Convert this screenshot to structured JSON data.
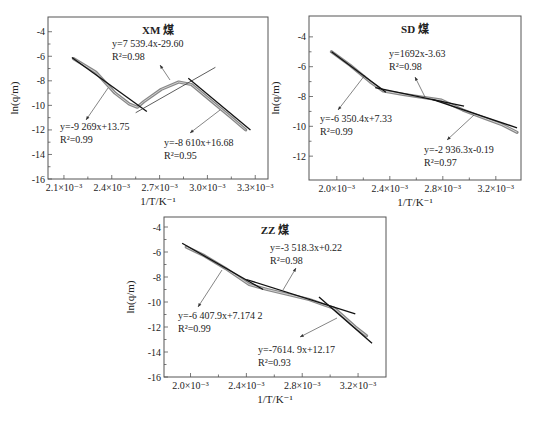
{
  "caption_top": "",
  "chart_data": [
    {
      "id": "xm",
      "type": "line",
      "title": "XM 煤",
      "xlabel": "1/T/K⁻¹",
      "ylabel": "ln(q/m)",
      "xlim": [
        2.0,
        3.38
      ],
      "ylim": [
        -16,
        -2.8
      ],
      "xticks": [
        2.1,
        2.4,
        2.7,
        3.0,
        3.3
      ],
      "xtick_labels": [
        "2.1×10⁻³",
        "2.4×10⁻³",
        "2.7×10⁻³",
        "3.0×10⁻³",
        "3.3×10⁻³"
      ],
      "yticks": [
        -4,
        -6,
        -8,
        -10,
        -12,
        -14,
        -16
      ],
      "ytick_labels": [
        "-4",
        "-6",
        "-8",
        "-10",
        "-12",
        "-14",
        "-16"
      ],
      "x_unit_scale": "×10⁻³",
      "frame_px": {
        "left": 48,
        "top": 17,
        "right": 268,
        "bottom": 179
      },
      "series": [
        {
          "name": "experimental",
          "x": [
            2.16,
            2.3,
            2.42,
            2.51,
            2.56,
            2.6,
            2.71,
            2.82,
            2.9,
            3.03,
            3.15,
            3.24
          ],
          "y": [
            -6.2,
            -7.3,
            -9.0,
            -9.9,
            -10.15,
            -9.7,
            -8.7,
            -8.1,
            -8.3,
            -9.7,
            -11.0,
            -12.0
          ]
        }
      ],
      "fits": [
        {
          "label": "y=-9 269x+13.75",
          "r2": "R²=0.99",
          "slope": -9269,
          "intercept": 13.75,
          "x_range": [
            2.15,
            2.62
          ],
          "y_range": [
            -6.1,
            -10.5
          ]
        },
        {
          "label": "y=7 539.4x-29.60",
          "r2": "R²=0.98",
          "slope": 7539.4,
          "intercept": -29.6,
          "x_range": [
            2.55,
            3.05
          ],
          "y_range": [
            -10.6,
            -6.9
          ]
        },
        {
          "label": "y=-8 610x+16.68",
          "r2": "R²=0.95",
          "slope": -8610,
          "intercept": 16.68,
          "x_range": [
            2.88,
            3.27
          ],
          "y_range": [
            -7.8,
            -12.0
          ]
        }
      ],
      "annotations": [
        {
          "eq": "y=7 539.4x-29.60",
          "r2": "R²=0.98",
          "text_px": [
            112,
            47
          ],
          "arrow_from": [
            170,
            80
          ],
          "arrow_to": [
            160,
            65
          ]
        },
        {
          "eq": "y=-9 269x+13.75",
          "r2": "R²=0.99",
          "text_px": [
            60,
            130
          ],
          "arrow_from": [
            108,
            88
          ],
          "arrow_to": [
            86,
            120
          ]
        },
        {
          "eq": "y=-8 610x+16.68",
          "r2": "R²=0.95",
          "text_px": [
            164,
            146
          ],
          "arrow_from": [
            220,
            110
          ],
          "arrow_to": [
            190,
            133
          ]
        }
      ]
    },
    {
      "id": "sd",
      "type": "line",
      "title": "SD 煤",
      "xlabel": "1/T/K⁻¹",
      "ylabel": "ln(q/m)",
      "xlim": [
        1.79,
        3.39
      ],
      "ylim": [
        -13.6,
        -2.6
      ],
      "xticks": [
        2.0,
        2.4,
        2.8,
        3.2
      ],
      "xtick_labels": [
        "2.0×10⁻³",
        "2.4×10⁻³",
        "2.8×10⁻³",
        "3.2×10⁻³"
      ],
      "yticks": [
        -4,
        -6,
        -8,
        -10,
        -12
      ],
      "ytick_labels": [
        "-4",
        "-6",
        "-8",
        "-10",
        "-12"
      ],
      "frame_px": {
        "left": 309,
        "top": 16,
        "right": 521,
        "bottom": 180
      },
      "series": [
        {
          "name": "experimental",
          "x": [
            1.96,
            2.1,
            2.25,
            2.35,
            2.5,
            2.65,
            2.79,
            2.95,
            3.1,
            3.25,
            3.36
          ],
          "y": [
            -5.0,
            -5.9,
            -7.0,
            -7.63,
            -7.85,
            -8.05,
            -8.25,
            -8.9,
            -9.4,
            -9.9,
            -10.4
          ]
        }
      ],
      "fits": [
        {
          "label": "y=-6 350.4x+7.33",
          "r2": "R²=0.99",
          "slope": -6350.4,
          "intercept": 7.33,
          "x_range": [
            1.96,
            2.37
          ],
          "y_range": [
            -5.0,
            -7.72
          ]
        },
        {
          "label": "y=1692x-3.63",
          "r2": "R²=0.98",
          "slope": 1692,
          "intercept": -3.63,
          "x_range": [
            2.29,
            2.96
          ],
          "y_range": [
            -7.4,
            -8.65
          ]
        },
        {
          "label": "y=-2 936.3x-0.19",
          "r2": "R²=0.97",
          "slope": -2936.3,
          "intercept": -0.19,
          "x_range": [
            2.72,
            3.36
          ],
          "y_range": [
            -8.2,
            -10.1
          ]
        }
      ],
      "annotations": [
        {
          "eq": "y=1692x-3.63",
          "r2": "R²=0.98",
          "text_px": [
            389,
            57
          ],
          "arrow_from": [
            425,
            97
          ],
          "arrow_to": [
            415,
            77
          ]
        },
        {
          "eq": "y=-6 350.4x+7.33",
          "r2": "R²=0.99",
          "text_px": [
            320,
            122
          ],
          "arrow_from": [
            365,
            75
          ],
          "arrow_to": [
            338,
            110
          ]
        },
        {
          "eq": "y=-2 936.3x-0.19",
          "r2": "R²=0.97",
          "text_px": [
            424,
            153
          ],
          "arrow_from": [
            474,
            115
          ],
          "arrow_to": [
            447,
            140
          ]
        }
      ]
    },
    {
      "id": "zz",
      "type": "line",
      "title": "ZZ 煤",
      "xlabel": "1/T/K⁻¹",
      "ylabel": "ln(q/m)",
      "xlim": [
        1.81,
        3.4
      ],
      "ylim": [
        -16,
        -3.2
      ],
      "xticks": [
        2.0,
        2.4,
        2.8,
        3.2
      ],
      "xtick_labels": [
        "2.0×10⁻³",
        "2.4×10⁻³",
        "2.8×10⁻³",
        "3.2×10⁻³"
      ],
      "yticks": [
        -4,
        -6,
        -8,
        -10,
        -12,
        -14,
        -16
      ],
      "ytick_labels": [
        "-4",
        "-6",
        "-8",
        "-10",
        "-12",
        "-14",
        "-16"
      ],
      "frame_px": {
        "left": 164,
        "top": 217,
        "right": 386,
        "bottom": 377
      },
      "series": [
        {
          "name": "experimental",
          "x": [
            1.97,
            2.1,
            2.25,
            2.42,
            2.55,
            2.7,
            2.85,
            2.95,
            3.03,
            3.1,
            3.18,
            3.26
          ],
          "y": [
            -5.6,
            -6.3,
            -7.3,
            -8.6,
            -9.0,
            -9.4,
            -9.8,
            -10.2,
            -10.5,
            -11.2,
            -12.0,
            -12.7
          ]
        }
      ],
      "fits": [
        {
          "label": "y=-6 407.9x+7.174 2",
          "r2": "R²=0.99",
          "slope": -6407.9,
          "intercept": 7.1742,
          "x_range": [
            1.94,
            2.52
          ],
          "y_range": [
            -5.3,
            -9.0
          ]
        },
        {
          "label": "y=-3 518.3x+0.22",
          "r2": "R²=0.98",
          "slope": -3518.3,
          "intercept": 0.22,
          "x_range": [
            2.4,
            3.18
          ],
          "y_range": [
            -8.2,
            -10.95
          ]
        },
        {
          "label": "y=-7 614.9x+12.17",
          "r2": "R²=0.93",
          "slope": -7614.9,
          "intercept": 12.17,
          "x_range": [
            2.92,
            3.3
          ],
          "y_range": [
            -9.6,
            -13.3
          ]
        }
      ],
      "annotations": [
        {
          "eq": "y=-3 518.3x+0.22",
          "r2": "R²=0.98",
          "text_px": [
            270,
            251
          ],
          "arrow_from": [
            283,
            290
          ],
          "arrow_to": [
            296,
            268
          ]
        },
        {
          "eq": "y=-6 407.9x+7.174 2",
          "r2": "R²=0.99",
          "text_px": [
            178,
            319
          ],
          "arrow_from": [
            222,
            270
          ],
          "arrow_to": [
            198,
            307
          ]
        },
        {
          "eq": "y=-7614. 9x+12.17",
          "r2": "R²=0.93",
          "text_px": [
            258,
            353
          ],
          "arrow_from": [
            337,
            318
          ],
          "arrow_to": [
            300,
            337
          ]
        }
      ]
    }
  ]
}
